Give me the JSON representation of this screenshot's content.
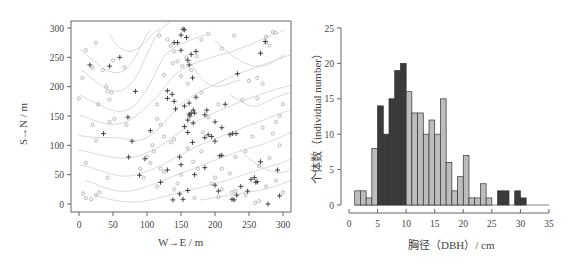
{
  "chart_data": [
    {
      "type": "scatter",
      "title": "",
      "xlabel": "W→E / m",
      "ylabel": "S→N / m",
      "xlim": [
        -10,
        310
      ],
      "ylim": [
        -12,
        310
      ],
      "xticks": [
        0,
        50,
        100,
        150,
        200,
        250,
        300
      ],
      "yticks": [
        0,
        50,
        100,
        150,
        200,
        250,
        300
      ],
      "grid": false,
      "background": "topographic contour lines (light gray)",
      "series": [
        {
          "name": "plus markers (dark)",
          "marker": "+",
          "color": "#333333",
          "points": [
            [
              153,
              298
            ],
            [
              155,
              297
            ],
            [
              150,
              288
            ],
            [
              158,
              284
            ],
            [
              140,
              275
            ],
            [
              145,
              275
            ],
            [
              150,
              262
            ],
            [
              160,
              245
            ],
            [
              162,
              237
            ],
            [
              165,
              255
            ],
            [
              172,
              260
            ],
            [
              167,
              215
            ],
            [
              16,
              237
            ],
            [
              45,
              235
            ],
            [
              60,
              250
            ],
            [
              83,
              192
            ],
            [
              130,
              193
            ],
            [
              137,
              187
            ],
            [
              140,
              175
            ],
            [
              142,
              162
            ],
            [
              130,
              180
            ],
            [
              155,
              167
            ],
            [
              162,
              172
            ],
            [
              172,
              182
            ],
            [
              165,
              155
            ],
            [
              168,
              160
            ],
            [
              170,
              155
            ],
            [
              162,
              153
            ],
            [
              160,
              143
            ],
            [
              163,
              150
            ],
            [
              168,
              138
            ],
            [
              155,
              132
            ],
            [
              160,
              122
            ],
            [
              185,
              152
            ],
            [
              188,
              160
            ],
            [
              200,
              140
            ],
            [
              210,
              130
            ],
            [
              190,
              118
            ],
            [
              195,
              115
            ],
            [
              200,
              107
            ],
            [
              185,
              113
            ],
            [
              222,
              118
            ],
            [
              226,
              120
            ],
            [
              231,
              120
            ],
            [
              233,
              222
            ],
            [
              215,
              170
            ],
            [
              105,
              125
            ],
            [
              78,
              107
            ],
            [
              36,
              120
            ],
            [
              72,
              148
            ],
            [
              73,
              80
            ],
            [
              97,
              77
            ],
            [
              148,
              80
            ],
            [
              150,
              67
            ],
            [
              130,
              58
            ],
            [
              167,
              105
            ],
            [
              210,
              83
            ],
            [
              207,
              82
            ],
            [
              185,
              62
            ],
            [
              170,
              50
            ],
            [
              89,
              49
            ],
            [
              120,
              37
            ],
            [
              160,
              23
            ],
            [
              148,
              17
            ],
            [
              153,
              8
            ],
            [
              138,
              7
            ],
            [
              200,
              32
            ],
            [
              205,
              22
            ],
            [
              225,
              8
            ],
            [
              228,
              7
            ],
            [
              238,
              30
            ],
            [
              232,
              15
            ],
            [
              248,
              22
            ],
            [
              253,
              42
            ],
            [
              258,
              45
            ],
            [
              260,
              37
            ],
            [
              262,
              38
            ],
            [
              267,
              72
            ],
            [
              267,
              257
            ],
            [
              274,
              277
            ],
            [
              292,
              58
            ],
            [
              278,
              0
            ],
            [
              295,
              14
            ]
          ]
        },
        {
          "name": "circle markers (light)",
          "marker": "o",
          "color": "#aaaaaa",
          "points": [
            [
              10,
              262
            ],
            [
              25,
              275
            ],
            [
              20,
              232
            ],
            [
              50,
              245
            ],
            [
              35,
              228
            ],
            [
              67,
              233
            ],
            [
              40,
              200
            ],
            [
              42,
              192
            ],
            [
              48,
              190
            ],
            [
              28,
              170
            ],
            [
              45,
              178
            ],
            [
              20,
              135
            ],
            [
              45,
              140
            ],
            [
              52,
              145
            ],
            [
              70,
              135
            ],
            [
              0,
              180
            ],
            [
              5,
              215
            ],
            [
              118,
              287
            ],
            [
              130,
              280
            ],
            [
              135,
              270
            ],
            [
              140,
              260
            ],
            [
              145,
              243
            ],
            [
              138,
              240
            ],
            [
              152,
              235
            ],
            [
              158,
              250
            ],
            [
              165,
              228
            ],
            [
              173,
              252
            ],
            [
              180,
              280
            ],
            [
              190,
              290
            ],
            [
              210,
              265
            ],
            [
              228,
              287
            ],
            [
              285,
              293
            ],
            [
              289,
              292
            ],
            [
              275,
              275
            ],
            [
              262,
              215
            ],
            [
              270,
              205
            ],
            [
              250,
              210
            ],
            [
              262,
              180
            ],
            [
              240,
              178
            ],
            [
              300,
              170
            ],
            [
              295,
              150
            ],
            [
              270,
              130
            ],
            [
              255,
              115
            ],
            [
              290,
              140
            ],
            [
              285,
              120
            ],
            [
              295,
              100
            ],
            [
              280,
              78
            ],
            [
              265,
              65
            ],
            [
              290,
              40
            ],
            [
              275,
              30
            ],
            [
              300,
              20
            ],
            [
              245,
              90
            ],
            [
              230,
              80
            ],
            [
              210,
              60
            ],
            [
              222,
              52
            ],
            [
              200,
              45
            ],
            [
              195,
              35
            ],
            [
              210,
              25
            ],
            [
              225,
              20
            ],
            [
              245,
              15
            ],
            [
              230,
              22
            ],
            [
              205,
              12
            ],
            [
              175,
              60
            ],
            [
              168,
              72
            ],
            [
              180,
              90
            ],
            [
              160,
              95
            ],
            [
              120,
              60
            ],
            [
              125,
              55
            ],
            [
              105,
              70
            ],
            [
              100,
              80
            ],
            [
              110,
              90
            ],
            [
              90,
              60
            ],
            [
              95,
              45
            ],
            [
              115,
              30
            ],
            [
              140,
              25
            ],
            [
              145,
              35
            ],
            [
              150,
              50
            ],
            [
              170,
              10
            ],
            [
              135,
              105
            ],
            [
              140,
              110
            ],
            [
              125,
              115
            ],
            [
              120,
              135
            ],
            [
              115,
              145
            ],
            [
              108,
              100
            ],
            [
              182,
              122
            ],
            [
              190,
              148
            ],
            [
              205,
              170
            ],
            [
              180,
              190
            ],
            [
              160,
              205
            ],
            [
              150,
              218
            ],
            [
              125,
              220
            ],
            [
              115,
              170
            ],
            [
              25,
              108
            ],
            [
              10,
              70
            ],
            [
              30,
              20
            ],
            [
              25,
              15
            ],
            [
              18,
              8
            ],
            [
              10,
              10
            ],
            [
              6,
              18
            ],
            [
              42,
              45
            ],
            [
              265,
              5
            ],
            [
              275,
              285
            ],
            [
              280,
              270
            ],
            [
              259,
              2
            ]
          ]
        }
      ]
    },
    {
      "type": "bar",
      "title": "",
      "xlabel": "胸径（DBH）/ cm",
      "ylabel": "个体数（individual number）",
      "xlim": [
        0,
        35
      ],
      "ylim": [
        0,
        25
      ],
      "xticks": [
        0,
        5,
        10,
        15,
        20,
        25,
        30,
        35
      ],
      "yticks": [
        0,
        5,
        10,
        15,
        20,
        25
      ],
      "grid": false,
      "bin_width": 1,
      "bins": [
        {
          "x0": 1,
          "x1": 2,
          "value": 2,
          "color": "light"
        },
        {
          "x0": 2,
          "x1": 3,
          "value": 2,
          "color": "light"
        },
        {
          "x0": 3,
          "x1": 4,
          "value": 1,
          "color": "light"
        },
        {
          "x0": 4,
          "x1": 5,
          "value": 8,
          "color": "light"
        },
        {
          "x0": 5,
          "x1": 6,
          "value": 14,
          "color": "dark"
        },
        {
          "x0": 6,
          "x1": 7,
          "value": 10,
          "color": "dark"
        },
        {
          "x0": 7,
          "x1": 8,
          "value": 15,
          "color": "dark"
        },
        {
          "x0": 8,
          "x1": 9,
          "value": 19,
          "color": "dark"
        },
        {
          "x0": 9,
          "x1": 10,
          "value": 20,
          "color": "dark"
        },
        {
          "x0": 10,
          "x1": 11,
          "value": 16,
          "color": "light"
        },
        {
          "x0": 11,
          "x1": 12,
          "value": 13,
          "color": "light"
        },
        {
          "x0": 12,
          "x1": 13,
          "value": 13,
          "color": "light"
        },
        {
          "x0": 13,
          "x1": 14,
          "value": 10,
          "color": "light"
        },
        {
          "x0": 14,
          "x1": 15,
          "value": 12,
          "color": "light"
        },
        {
          "x0": 15,
          "x1": 16,
          "value": 10,
          "color": "light"
        },
        {
          "x0": 16,
          "x1": 17,
          "value": 15,
          "color": "light"
        },
        {
          "x0": 17,
          "x1": 18,
          "value": 6,
          "color": "light"
        },
        {
          "x0": 18,
          "x1": 19,
          "value": 2,
          "color": "light"
        },
        {
          "x0": 19,
          "x1": 20,
          "value": 4,
          "color": "light"
        },
        {
          "x0": 20,
          "x1": 21,
          "value": 7,
          "color": "light"
        },
        {
          "x0": 21,
          "x1": 22,
          "value": 1,
          "color": "light"
        },
        {
          "x0": 22,
          "x1": 23,
          "value": 1,
          "color": "light"
        },
        {
          "x0": 23,
          "x1": 24,
          "value": 3,
          "color": "light"
        },
        {
          "x0": 24,
          "x1": 25,
          "value": 1,
          "color": "light"
        },
        {
          "x0": 26,
          "x1": 27,
          "value": 2,
          "color": "dark"
        },
        {
          "x0": 27,
          "x1": 28,
          "value": 2,
          "color": "dark"
        },
        {
          "x0": 29,
          "x1": 30,
          "value": 2,
          "color": "dark"
        },
        {
          "x0": 30,
          "x1": 31,
          "value": 1,
          "color": "dark"
        }
      ],
      "colors": {
        "light": "#bdbdbd",
        "dark": "#3a3a3a",
        "edge": "#333333"
      }
    }
  ],
  "labels": {
    "left_xlabel": "W→E / m",
    "left_ylabel": "S→N / m",
    "right_xlabel": "胸径（DBH）/ cm",
    "right_ylabel": "个体数（individual number）"
  }
}
